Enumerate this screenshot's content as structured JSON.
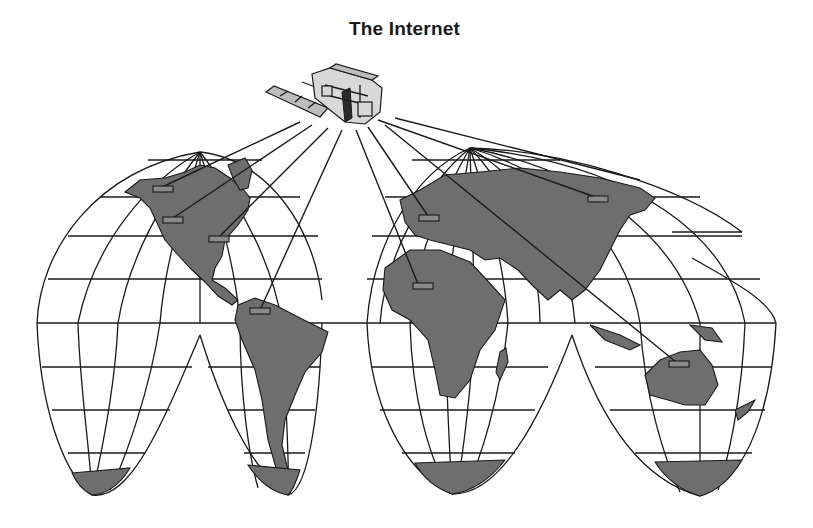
{
  "title": "The Internet",
  "colors": {
    "land": "#6e6e6e",
    "ink": "#1a1a1a",
    "background": "#ffffff",
    "node": "#8a8a8a"
  },
  "illustration": {
    "projection": "interrupted (Goode homolosine-style) world map",
    "satellite": {
      "label": "satellite",
      "icon": "satellite-icon"
    },
    "nodes": [
      {
        "id": "alaska-west-canada",
        "region": "North America (northwest)"
      },
      {
        "id": "western-usa",
        "region": "North America (west)"
      },
      {
        "id": "eastern-usa",
        "region": "North America (east)"
      },
      {
        "id": "northern-south-america",
        "region": "South America (north)"
      },
      {
        "id": "western-europe",
        "region": "Europe"
      },
      {
        "id": "west-africa",
        "region": "Africa (west)"
      },
      {
        "id": "siberia",
        "region": "Asia (Siberia)"
      },
      {
        "id": "northern-australia",
        "region": "Australia"
      }
    ],
    "beam_count": 9
  }
}
